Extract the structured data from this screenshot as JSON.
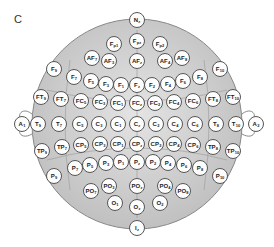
{
  "panel_label": "C",
  "diagram": {
    "head": {
      "cx": 137,
      "cy": 124,
      "r": 105,
      "fill": "#c9c9c9",
      "stroke": "#888888"
    },
    "electrodes": [
      {
        "b": "N",
        "s": "z",
        "x": 137,
        "y": 20
      },
      {
        "b": "F",
        "s": "p1",
        "x": 114,
        "y": 44
      },
      {
        "b": "F",
        "s": "pz",
        "x": 137,
        "y": 41
      },
      {
        "b": "F",
        "s": "p2",
        "x": 160,
        "y": 44
      },
      {
        "b": "AF",
        "s": "7",
        "x": 92,
        "y": 58
      },
      {
        "b": "AF",
        "s": "3",
        "x": 109,
        "y": 61
      },
      {
        "b": "AF",
        "s": "z",
        "x": 137,
        "y": 61
      },
      {
        "b": "AF",
        "s": "4",
        "x": 165,
        "y": 61
      },
      {
        "b": "AF",
        "s": "8",
        "x": 182,
        "y": 58
      },
      {
        "b": "F",
        "s": "9",
        "x": 54,
        "y": 69
      },
      {
        "b": "F",
        "s": "7",
        "x": 74,
        "y": 77
      },
      {
        "b": "F",
        "s": "5",
        "x": 91,
        "y": 81
      },
      {
        "b": "F",
        "s": "3",
        "x": 106,
        "y": 84
      },
      {
        "b": "F",
        "s": "1",
        "x": 121,
        "y": 85
      },
      {
        "b": "F",
        "s": "z",
        "x": 137,
        "y": 85
      },
      {
        "b": "F",
        "s": "2",
        "x": 152,
        "y": 85
      },
      {
        "b": "F",
        "s": "4",
        "x": 168,
        "y": 84
      },
      {
        "b": "F",
        "s": "6",
        "x": 183,
        "y": 81
      },
      {
        "b": "F",
        "s": "8",
        "x": 200,
        "y": 77
      },
      {
        "b": "F",
        "s": "10",
        "x": 220,
        "y": 69
      },
      {
        "b": "FT",
        "s": "9",
        "x": 41,
        "y": 97
      },
      {
        "b": "FT",
        "s": "7",
        "x": 61,
        "y": 99
      },
      {
        "b": "FC",
        "s": "5",
        "x": 81,
        "y": 101
      },
      {
        "b": "FC",
        "s": "3",
        "x": 100,
        "y": 102
      },
      {
        "b": "FC",
        "s": "1",
        "x": 118,
        "y": 103
      },
      {
        "b": "FC",
        "s": "z",
        "x": 137,
        "y": 103
      },
      {
        "b": "FC",
        "s": "2",
        "x": 155,
        "y": 103
      },
      {
        "b": "FC",
        "s": "4",
        "x": 174,
        "y": 102
      },
      {
        "b": "FC",
        "s": "6",
        "x": 193,
        "y": 101
      },
      {
        "b": "FT",
        "s": "8",
        "x": 213,
        "y": 99
      },
      {
        "b": "FT",
        "s": "10",
        "x": 233,
        "y": 97
      },
      {
        "b": "A",
        "s": "1",
        "x": 22,
        "y": 124
      },
      {
        "b": "T",
        "s": "9",
        "x": 38,
        "y": 124
      },
      {
        "b": "T",
        "s": "7",
        "x": 59,
        "y": 124
      },
      {
        "b": "C",
        "s": "5",
        "x": 80,
        "y": 124
      },
      {
        "b": "C",
        "s": "3",
        "x": 99,
        "y": 124
      },
      {
        "b": "C",
        "s": "1",
        "x": 118,
        "y": 124
      },
      {
        "b": "C",
        "s": "z",
        "x": 137,
        "y": 124
      },
      {
        "b": "C",
        "s": "2",
        "x": 156,
        "y": 124
      },
      {
        "b": "C",
        "s": "4",
        "x": 175,
        "y": 124
      },
      {
        "b": "C",
        "s": "6",
        "x": 195,
        "y": 124
      },
      {
        "b": "T",
        "s": "8",
        "x": 216,
        "y": 124
      },
      {
        "b": "T",
        "s": "10",
        "x": 236,
        "y": 124
      },
      {
        "b": "A",
        "s": "2",
        "x": 256,
        "y": 124
      },
      {
        "b": "TP",
        "s": "9",
        "x": 42,
        "y": 151
      },
      {
        "b": "TP",
        "s": "7",
        "x": 62,
        "y": 147
      },
      {
        "b": "CP",
        "s": "5",
        "x": 81,
        "y": 145
      },
      {
        "b": "CP",
        "s": "3",
        "x": 100,
        "y": 144
      },
      {
        "b": "CP",
        "s": "1",
        "x": 118,
        "y": 144
      },
      {
        "b": "CP",
        "s": "z",
        "x": 137,
        "y": 144
      },
      {
        "b": "CP",
        "s": "2",
        "x": 156,
        "y": 144
      },
      {
        "b": "CP",
        "s": "4",
        "x": 174,
        "y": 144
      },
      {
        "b": "CP",
        "s": "6",
        "x": 193,
        "y": 145
      },
      {
        "b": "TP",
        "s": "8",
        "x": 213,
        "y": 147
      },
      {
        "b": "TP",
        "s": "10",
        "x": 233,
        "y": 151
      },
      {
        "b": "P",
        "s": "9",
        "x": 54,
        "y": 176
      },
      {
        "b": "P",
        "s": "7",
        "x": 75,
        "y": 168
      },
      {
        "b": "P",
        "s": "5",
        "x": 90,
        "y": 165
      },
      {
        "b": "P",
        "s": "3",
        "x": 106,
        "y": 163
      },
      {
        "b": "P",
        "s": "1",
        "x": 121,
        "y": 162
      },
      {
        "b": "P",
        "s": "z",
        "x": 137,
        "y": 162
      },
      {
        "b": "P",
        "s": "2",
        "x": 153,
        "y": 162
      },
      {
        "b": "P",
        "s": "4",
        "x": 168,
        "y": 163
      },
      {
        "b": "P",
        "s": "6",
        "x": 184,
        "y": 165
      },
      {
        "b": "P",
        "s": "8",
        "x": 200,
        "y": 168
      },
      {
        "b": "P",
        "s": "10",
        "x": 220,
        "y": 176
      },
      {
        "b": "PO",
        "s": "7",
        "x": 91,
        "y": 191
      },
      {
        "b": "PO",
        "s": "3",
        "x": 109,
        "y": 186
      },
      {
        "b": "PO",
        "s": "z",
        "x": 137,
        "y": 186
      },
      {
        "b": "PO",
        "s": "4",
        "x": 165,
        "y": 186
      },
      {
        "b": "PO",
        "s": "8",
        "x": 183,
        "y": 191
      },
      {
        "b": "O",
        "s": "1",
        "x": 115,
        "y": 203
      },
      {
        "b": "O",
        "s": "z",
        "x": 137,
        "y": 207
      },
      {
        "b": "O",
        "s": "2",
        "x": 160,
        "y": 203
      },
      {
        "b": "I",
        "s": "z",
        "x": 137,
        "y": 228
      }
    ]
  }
}
